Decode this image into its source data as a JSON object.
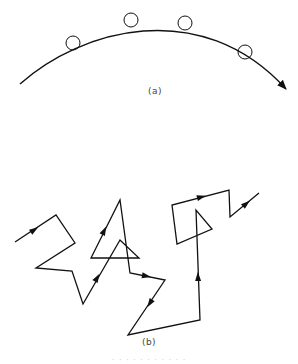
{
  "figure": {
    "panel_a": {
      "label": "(a)",
      "description": "smooth curved trajectory with circles marking positions along the path, ending in an arrow",
      "curve": {
        "start": [
          20,
          84
        ],
        "control1": [
          80,
          30
        ],
        "control2": [
          200,
          -5
        ],
        "end": [
          286,
          89
        ]
      },
      "circles": [
        {
          "cx": 73,
          "cy": 43,
          "r": 7
        },
        {
          "cx": 131,
          "cy": 20,
          "r": 7
        },
        {
          "cx": 185,
          "cy": 23,
          "r": 7
        },
        {
          "cx": 245,
          "cy": 52,
          "r": 7
        }
      ],
      "stroke_color": "#111111"
    },
    "panel_b": {
      "label": "(b)",
      "description": "random-walk zig-zag trajectory made of straight segments with direction arrows",
      "path_points": [
        [
          15,
          242
        ],
        [
          56,
          215
        ],
        [
          75,
          243
        ],
        [
          36,
          268
        ],
        [
          72,
          271
        ],
        [
          83,
          304
        ],
        [
          120,
          240
        ],
        [
          139,
          258
        ],
        [
          91,
          258
        ],
        [
          120,
          200
        ],
        [
          130,
          273
        ],
        [
          165,
          280
        ],
        [
          128,
          335
        ],
        [
          200,
          320
        ],
        [
          196,
          210
        ],
        [
          212,
          229
        ],
        [
          177,
          244
        ],
        [
          172,
          205
        ],
        [
          229,
          190
        ],
        [
          230,
          217
        ],
        [
          259,
          193
        ]
      ],
      "arrowheads": [
        {
          "x": 34,
          "y": 230,
          "angle": -33
        },
        {
          "x": 97,
          "y": 278,
          "angle": -60
        },
        {
          "x": 104,
          "y": 231,
          "angle": -64
        },
        {
          "x": 146,
          "y": 276,
          "angle": 11
        },
        {
          "x": 150,
          "y": 303,
          "angle": 123
        },
        {
          "x": 198,
          "y": 277,
          "angle": -92
        },
        {
          "x": 201,
          "y": 197,
          "angle": -15
        },
        {
          "x": 246,
          "y": 204,
          "angle": -40
        }
      ],
      "stroke_color": "#111111"
    },
    "caption": "· · ·   · ·   ·   · · ·   · ·"
  }
}
